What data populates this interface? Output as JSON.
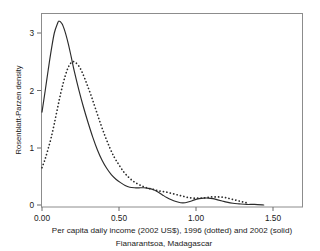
{
  "chart_data": {
    "type": "line",
    "title": "",
    "xlabel": "Per capita daily income (2002 US$), 1996 (dotted) and 2002 (solid)",
    "ylabel": "Rosenblatt-Parzen density",
    "subcaption": "Fianarantsoa, Madagascar",
    "xlim": [
      0.0,
      1.7
    ],
    "ylim": [
      0.0,
      3.45
    ],
    "grid": false,
    "legend_position": "none",
    "xticks": [
      0.0,
      0.5,
      1.0,
      1.5
    ],
    "xtick_labels": [
      "0.00",
      "0.50",
      "1.00",
      "1.50"
    ],
    "yticks": [
      0,
      1,
      2,
      3
    ],
    "ytick_labels": [
      "0",
      "1",
      "2",
      "3"
    ],
    "series": [
      {
        "name": "2002 (solid)",
        "style": "solid",
        "color": "#2b2b2b",
        "x": [
          0.0,
          0.02,
          0.04,
          0.06,
          0.08,
          0.1,
          0.11,
          0.13,
          0.15,
          0.17,
          0.19,
          0.21,
          0.24,
          0.27,
          0.3,
          0.33,
          0.36,
          0.39,
          0.42,
          0.45,
          0.48,
          0.51,
          0.54,
          0.57,
          0.6,
          0.63,
          0.66,
          0.69,
          0.72,
          0.75,
          0.78,
          0.81,
          0.84,
          0.87,
          0.9,
          0.93,
          0.96,
          0.99,
          1.02,
          1.05,
          1.08,
          1.11,
          1.14,
          1.17,
          1.2,
          1.24,
          1.28,
          1.33,
          1.38,
          1.44
        ],
        "y": [
          1.62,
          1.98,
          2.35,
          2.7,
          3.0,
          3.16,
          3.21,
          3.16,
          3.02,
          2.82,
          2.58,
          2.33,
          2.0,
          1.7,
          1.43,
          1.18,
          0.96,
          0.78,
          0.64,
          0.53,
          0.45,
          0.39,
          0.34,
          0.31,
          0.3,
          0.3,
          0.3,
          0.29,
          0.27,
          0.23,
          0.18,
          0.13,
          0.09,
          0.06,
          0.04,
          0.04,
          0.06,
          0.09,
          0.11,
          0.12,
          0.12,
          0.11,
          0.09,
          0.07,
          0.05,
          0.03,
          0.02,
          0.01,
          0.01,
          0.0
        ]
      },
      {
        "name": "1996 (dotted)",
        "style": "dotted",
        "color": "#2b2b2b",
        "x": [
          0.0,
          0.02,
          0.04,
          0.06,
          0.08,
          0.1,
          0.12,
          0.14,
          0.16,
          0.18,
          0.2,
          0.22,
          0.24,
          0.26,
          0.29,
          0.32,
          0.35,
          0.38,
          0.41,
          0.44,
          0.47,
          0.5,
          0.53,
          0.56,
          0.59,
          0.62,
          0.65,
          0.68,
          0.71,
          0.74,
          0.77,
          0.8,
          0.83,
          0.86,
          0.89,
          0.92,
          0.95,
          0.98,
          1.01,
          1.04,
          1.07,
          1.1,
          1.13,
          1.16,
          1.19,
          1.22,
          1.25,
          1.28,
          1.31,
          1.34
        ],
        "y": [
          0.65,
          0.8,
          0.98,
          1.18,
          1.42,
          1.68,
          1.93,
          2.15,
          2.33,
          2.45,
          2.5,
          2.48,
          2.42,
          2.32,
          2.12,
          1.9,
          1.66,
          1.42,
          1.2,
          1.0,
          0.83,
          0.7,
          0.58,
          0.49,
          0.42,
          0.37,
          0.33,
          0.3,
          0.28,
          0.26,
          0.24,
          0.23,
          0.21,
          0.19,
          0.17,
          0.15,
          0.13,
          0.12,
          0.12,
          0.12,
          0.13,
          0.14,
          0.14,
          0.14,
          0.13,
          0.11,
          0.09,
          0.07,
          0.05,
          0.03
        ]
      }
    ]
  },
  "axes": {
    "ylabel": "Rosenblatt-Parzen density",
    "xlabel": "Per capita daily income (2002 US$), 1996 (dotted) and 2002 (solid)",
    "caption": "Fianarantsoa, Madagascar",
    "xtick_labels": [
      "0.00",
      "0.50",
      "1.00",
      "1.50"
    ],
    "ytick_labels": [
      "0",
      "1",
      "2",
      "3"
    ]
  },
  "colors": {
    "frame": "#8c8c8c",
    "curve": "#2b2b2b",
    "text": "#1a1a1a",
    "background": "#ffffff"
  }
}
